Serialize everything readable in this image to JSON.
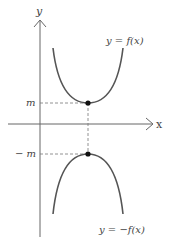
{
  "axes": {
    "x_label": "x",
    "y_label": "y"
  },
  "curves": {
    "upper_label": "y = f(x)",
    "lower_label": "y = −f(x)"
  },
  "ticks": {
    "m_label": "m",
    "neg_m_label": "− m"
  },
  "colors": {
    "curve": "#555555",
    "axis": "#666666",
    "dash": "#777777",
    "point": "#111111"
  }
}
